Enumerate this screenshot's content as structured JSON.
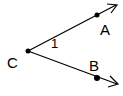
{
  "diagram": {
    "type": "angle",
    "vertex": {
      "label": "C",
      "x": 28,
      "y": 51
    },
    "rays": [
      {
        "name": "CA",
        "point_label": "A",
        "point": {
          "x": 97,
          "y": 15
        },
        "arrow_end": {
          "x": 116,
          "y": 5
        }
      },
      {
        "name": "CB",
        "point_label": "B",
        "point": {
          "x": 97,
          "y": 78
        },
        "arrow_end": {
          "x": 117,
          "y": 84
        }
      }
    ],
    "angle_label": "1",
    "colors": {
      "stroke": "#000000",
      "background": "#ffffff"
    }
  }
}
